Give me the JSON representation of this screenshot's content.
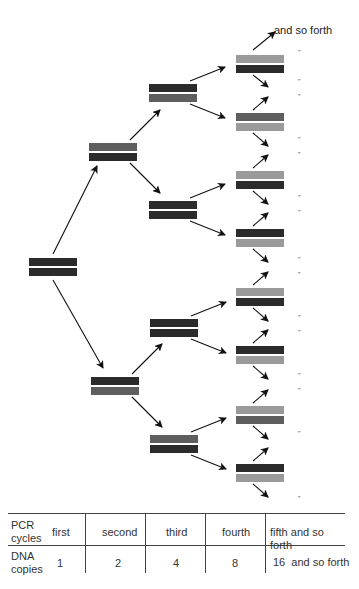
{
  "colors": {
    "dark": "#2b2b2b",
    "medium": "#5e5e5e",
    "light": "#9a9a9a",
    "arrow": "#111111",
    "rule": "#444444"
  },
  "diagram": {
    "continuation_label": "and so forth",
    "ditto_mark": "\"",
    "ditto_y": [
      52,
      81,
      96,
      139,
      154,
      197,
      212,
      259,
      274,
      317,
      332,
      375,
      390,
      433,
      498
    ],
    "bars": [
      {
        "level": 1,
        "x": 29,
        "y": 258,
        "top": "dark",
        "bottom": "dark"
      },
      {
        "level": 2,
        "x": 89,
        "y": 143,
        "top": "medium",
        "bottom": "dark"
      },
      {
        "level": 2,
        "x": 91,
        "y": 377,
        "top": "dark",
        "bottom": "medium"
      },
      {
        "level": 3,
        "x": 149,
        "y": 84,
        "top": "dark",
        "bottom": "medium"
      },
      {
        "level": 3,
        "x": 149,
        "y": 201,
        "top": "dark",
        "bottom": "dark"
      },
      {
        "level": 3,
        "x": 150,
        "y": 319,
        "top": "dark",
        "bottom": "dark"
      },
      {
        "level": 3,
        "x": 150,
        "y": 435,
        "top": "medium",
        "bottom": "dark"
      },
      {
        "level": 4,
        "x": 236,
        "y": 55,
        "top": "light",
        "bottom": "dark"
      },
      {
        "level": 4,
        "x": 236,
        "y": 113,
        "top": "medium",
        "bottom": "light"
      },
      {
        "level": 4,
        "x": 236,
        "y": 171,
        "top": "light",
        "bottom": "dark"
      },
      {
        "level": 4,
        "x": 236,
        "y": 229,
        "top": "dark",
        "bottom": "light"
      },
      {
        "level": 4,
        "x": 236,
        "y": 288,
        "top": "light",
        "bottom": "dark"
      },
      {
        "level": 4,
        "x": 236,
        "y": 346,
        "top": "dark",
        "bottom": "light"
      },
      {
        "level": 4,
        "x": 236,
        "y": 406,
        "top": "light",
        "bottom": "medium"
      },
      {
        "level": 4,
        "x": 236,
        "y": 464,
        "top": "dark",
        "bottom": "light"
      }
    ],
    "arrows": [
      {
        "x1": 53,
        "y1": 254,
        "x2": 97,
        "y2": 166
      },
      {
        "x1": 53,
        "y1": 280,
        "x2": 103,
        "y2": 368
      },
      {
        "x1": 130,
        "y1": 140,
        "x2": 160,
        "y2": 110
      },
      {
        "x1": 130,
        "y1": 163,
        "x2": 160,
        "y2": 193
      },
      {
        "x1": 132,
        "y1": 374,
        "x2": 162,
        "y2": 344
      },
      {
        "x1": 132,
        "y1": 397,
        "x2": 162,
        "y2": 427
      },
      {
        "x1": 190,
        "y1": 81,
        "x2": 225,
        "y2": 67
      },
      {
        "x1": 190,
        "y1": 104,
        "x2": 225,
        "y2": 118
      },
      {
        "x1": 190,
        "y1": 198,
        "x2": 225,
        "y2": 184
      },
      {
        "x1": 190,
        "y1": 221,
        "x2": 225,
        "y2": 235
      },
      {
        "x1": 191,
        "y1": 316,
        "x2": 226,
        "y2": 302
      },
      {
        "x1": 191,
        "y1": 339,
        "x2": 226,
        "y2": 353
      },
      {
        "x1": 191,
        "y1": 432,
        "x2": 226,
        "y2": 418
      },
      {
        "x1": 191,
        "y1": 455,
        "x2": 226,
        "y2": 469
      },
      {
        "x1": 253,
        "y1": 50,
        "x2": 275,
        "y2": 32
      },
      {
        "x1": 253,
        "y1": 75,
        "x2": 268,
        "y2": 87
      },
      {
        "x1": 253,
        "y1": 110,
        "x2": 268,
        "y2": 97
      },
      {
        "x1": 253,
        "y1": 133,
        "x2": 268,
        "y2": 146
      },
      {
        "x1": 253,
        "y1": 168,
        "x2": 268,
        "y2": 155
      },
      {
        "x1": 253,
        "y1": 191,
        "x2": 268,
        "y2": 204
      },
      {
        "x1": 253,
        "y1": 226,
        "x2": 268,
        "y2": 213
      },
      {
        "x1": 253,
        "y1": 249,
        "x2": 268,
        "y2": 262
      },
      {
        "x1": 253,
        "y1": 285,
        "x2": 268,
        "y2": 272
      },
      {
        "x1": 253,
        "y1": 308,
        "x2": 268,
        "y2": 321
      },
      {
        "x1": 253,
        "y1": 343,
        "x2": 268,
        "y2": 330
      },
      {
        "x1": 253,
        "y1": 366,
        "x2": 268,
        "y2": 379
      },
      {
        "x1": 253,
        "y1": 403,
        "x2": 268,
        "y2": 390
      },
      {
        "x1": 253,
        "y1": 426,
        "x2": 268,
        "y2": 439
      },
      {
        "x1": 253,
        "y1": 461,
        "x2": 268,
        "y2": 448
      },
      {
        "x1": 253,
        "y1": 484,
        "x2": 268,
        "y2": 497
      }
    ]
  },
  "table": {
    "rows": [
      {
        "header": "PCR cycles",
        "header_lines": [
          "PCR",
          "cycles"
        ],
        "cells": [
          "first",
          "second",
          "third",
          "fourth",
          "fifth and so forth"
        ]
      },
      {
        "header": "DNA copies",
        "header_lines": [
          "DNA",
          "copies"
        ],
        "cells": [
          "1",
          "2",
          "4",
          "8",
          "16  and so forth"
        ]
      }
    ]
  }
}
